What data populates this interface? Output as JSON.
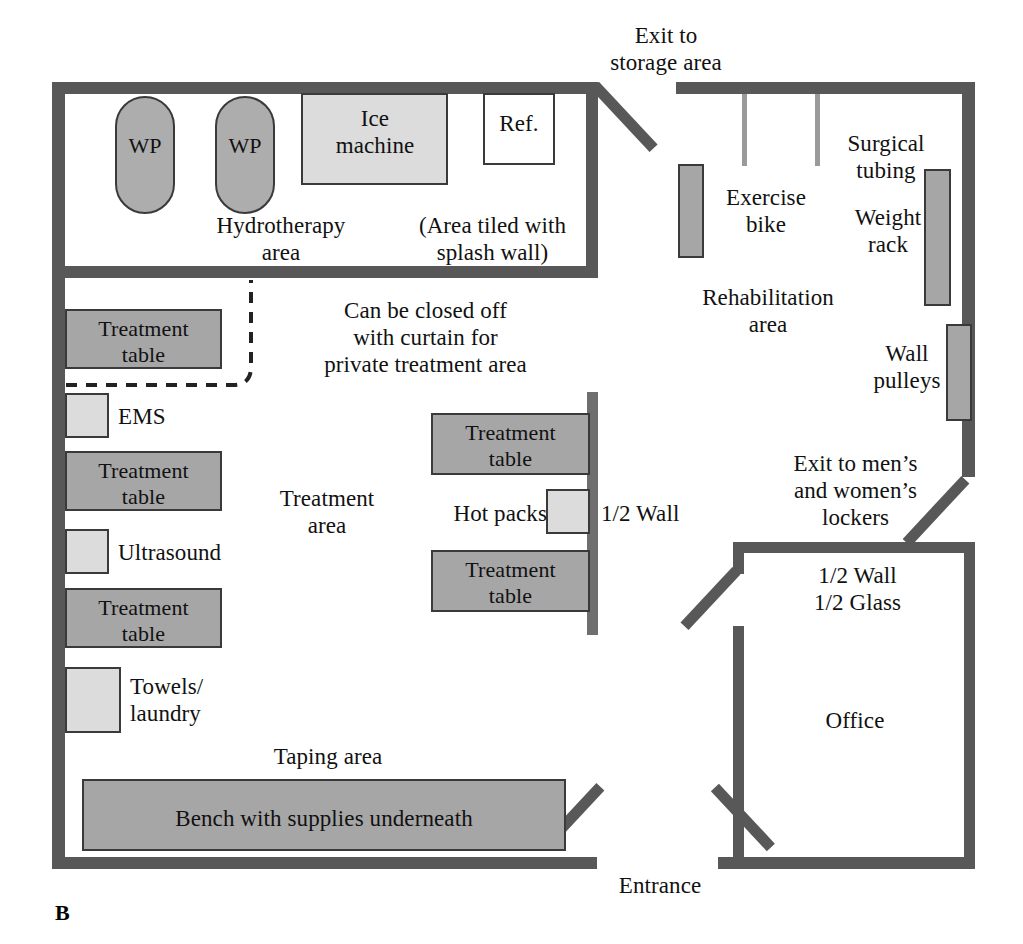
{
  "figure": {
    "panel_letter": "B",
    "colors": {
      "wall": "#585858",
      "thin_wall": "#6f6f6f",
      "furniture_dark": "#9e9e9e",
      "furniture_light": "#d8d8d8",
      "furniture_mid": "#a8a8a8",
      "outline": "#3a3a3a",
      "background": "#ffffff",
      "text": "#111111"
    }
  },
  "labels": {
    "exit_storage": "Exit to\nstorage area",
    "wp_left": "WP",
    "wp_right": "WP",
    "ice_machine": "Ice\nmachine",
    "refrigerator": "Ref.",
    "hydrotherapy_area": "Hydrotherapy\narea",
    "area_tiled": "(Area tiled with\nsplash wall)",
    "surgical_tubing": "Surgical\ntubing",
    "exercise_bike": "Exercise\nbike",
    "weight_rack": "Weight\nrack",
    "rehabilitation_area": "Rehabilitation\narea",
    "wall_pulleys": "Wall\npulleys",
    "curtain_note": "Can be closed off\nwith curtain for\nprivate treatment area",
    "treatment_table_1": "Treatment\ntable",
    "ems": "EMS",
    "treatment_table_2": "Treatment\ntable",
    "ultrasound": "Ultrasound",
    "treatment_table_3": "Treatment\ntable",
    "towels_laundry": "Towels/\nlaundry",
    "treatment_area": "Treatment\narea",
    "treatment_table_4": "Treatment\ntable",
    "hot_packs": "Hot packs",
    "half_wall": "1/2 Wall",
    "treatment_table_5": "Treatment\ntable",
    "exit_lockers": "Exit to men’s\nand women’s\nlockers",
    "half_wall_half_glass": "1/2 Wall\n1/2 Glass",
    "office": "Office",
    "taping_area": "Taping area",
    "bench": "Bench with supplies underneath",
    "entrance": "Entrance"
  },
  "rooms": [
    {
      "name": "hydrotherapy-area"
    },
    {
      "name": "treatment-area"
    },
    {
      "name": "rehabilitation-area"
    },
    {
      "name": "office"
    },
    {
      "name": "taping-area"
    }
  ],
  "equipment": [
    {
      "name": "whirlpool-left",
      "label": "WP",
      "shape": "rounded"
    },
    {
      "name": "whirlpool-right",
      "label": "WP",
      "shape": "rounded"
    },
    {
      "name": "ice-machine",
      "label": "Ice machine",
      "shape": "rect"
    },
    {
      "name": "refrigerator",
      "label": "Ref.",
      "shape": "rect"
    },
    {
      "name": "exercise-bike",
      "label": "Exercise bike",
      "shape": "rect"
    },
    {
      "name": "weight-rack",
      "label": "Weight rack",
      "shape": "rect"
    },
    {
      "name": "wall-pulleys",
      "label": "Wall pulleys",
      "shape": "rect"
    },
    {
      "name": "surgical-tubing",
      "label": "Surgical tubing",
      "shape": "line"
    },
    {
      "name": "treatment-table-1",
      "label": "Treatment table",
      "shape": "rect"
    },
    {
      "name": "ems-unit",
      "label": "EMS",
      "shape": "rect"
    },
    {
      "name": "treatment-table-2",
      "label": "Treatment table",
      "shape": "rect"
    },
    {
      "name": "ultrasound-unit",
      "label": "Ultrasound",
      "shape": "rect"
    },
    {
      "name": "treatment-table-3",
      "label": "Treatment table",
      "shape": "rect"
    },
    {
      "name": "towels-laundry",
      "label": "Towels/laundry",
      "shape": "rect"
    },
    {
      "name": "treatment-table-4",
      "label": "Treatment table",
      "shape": "rect"
    },
    {
      "name": "hot-packs",
      "label": "Hot packs",
      "shape": "rect"
    },
    {
      "name": "treatment-table-5",
      "label": "Treatment table",
      "shape": "rect"
    },
    {
      "name": "supply-bench",
      "label": "Bench with supplies underneath",
      "shape": "rect"
    }
  ],
  "doors": [
    {
      "name": "exit-storage-door"
    },
    {
      "name": "exit-lockers-door"
    },
    {
      "name": "office-door"
    },
    {
      "name": "entrance-door-left"
    },
    {
      "name": "entrance-door-right"
    }
  ]
}
